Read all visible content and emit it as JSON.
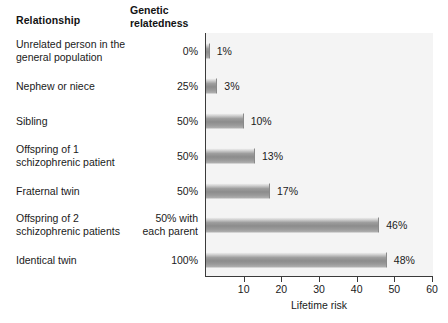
{
  "headers": {
    "relationship": "Relationship",
    "relatedness_line1": "Genetic",
    "relatedness_line2": "relatedness"
  },
  "chart_data": {
    "type": "bar",
    "orientation": "horizontal",
    "title": "",
    "xlabel": "Lifetime risk",
    "ylabel": "",
    "xlim": [
      0,
      60
    ],
    "xticks": [
      10,
      20,
      30,
      40,
      50,
      60
    ],
    "grid": false,
    "legend": null,
    "categories": [
      "Unrelated person in the general population",
      "Nephew or niece",
      "Sibling",
      "Offspring of 1 schizophrenic patient",
      "Fraternal twin",
      "Offspring of 2 schizophrenic patients",
      "Identical twin"
    ],
    "values": [
      1,
      3,
      10,
      13,
      17,
      46,
      48
    ],
    "value_labels": [
      "1%",
      "3%",
      "10%",
      "13%",
      "17%",
      "46%",
      "48%"
    ],
    "relatedness": [
      "0%",
      "25%",
      "50%",
      "50%",
      "50%",
      "50% with each parent",
      "100%"
    ]
  },
  "rows": [
    {
      "label_line1": "Unrelated person in the",
      "label_line2": "general population",
      "relatedness_line1": "0%",
      "relatedness_line2": "",
      "value_label": "1%",
      "value": 1
    },
    {
      "label_line1": "Nephew or niece",
      "label_line2": "",
      "relatedness_line1": "25%",
      "relatedness_line2": "",
      "value_label": "3%",
      "value": 3
    },
    {
      "label_line1": "Sibling",
      "label_line2": "",
      "relatedness_line1": "50%",
      "relatedness_line2": "",
      "value_label": "10%",
      "value": 10
    },
    {
      "label_line1": "Offspring of 1",
      "label_line2": "schizophrenic patient",
      "relatedness_line1": "50%",
      "relatedness_line2": "",
      "value_label": "13%",
      "value": 13
    },
    {
      "label_line1": "Fraternal twin",
      "label_line2": "",
      "relatedness_line1": "50%",
      "relatedness_line2": "",
      "value_label": "17%",
      "value": 17
    },
    {
      "label_line1": "Offspring of 2",
      "label_line2": "schizophrenic patients",
      "relatedness_line1": "50% with",
      "relatedness_line2": "each parent",
      "value_label": "46%",
      "value": 46
    },
    {
      "label_line1": "Identical twin",
      "label_line2": "",
      "relatedness_line1": "100%",
      "relatedness_line2": "",
      "value_label": "48%",
      "value": 48
    }
  ],
  "colors": {
    "bar_fill_light": "#d6d6d6",
    "bar_fill_dark": "#8c8c8c",
    "axis": "#3a3a3a",
    "plot_background": "#f4f4f4",
    "text": "#1a1a1a"
  }
}
